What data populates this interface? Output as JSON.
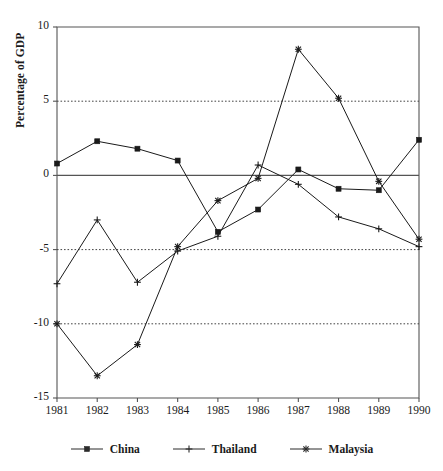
{
  "chart_data": {
    "type": "line",
    "title": "",
    "xlabel": "",
    "ylabel": "Percentage of GDP",
    "categories": [
      "1981",
      "1982",
      "1983",
      "1984",
      "1985",
      "1986",
      "1987",
      "1988",
      "1989",
      "1990"
    ],
    "x": [
      1981,
      1982,
      1983,
      1984,
      1985,
      1986,
      1987,
      1988,
      1989,
      1990
    ],
    "ylim": [
      -15,
      10
    ],
    "xlim": [
      1981,
      1990
    ],
    "yticks": [
      10,
      5,
      0,
      -5,
      -10,
      -15
    ],
    "ytick_labels": [
      "10",
      "5",
      "0",
      "-5",
      "-10",
      "-15"
    ],
    "gridlines_dotted_at": [
      5,
      -5,
      -10
    ],
    "zero_line": 0,
    "grid": "horizontal-dotted",
    "legend_position": "bottom",
    "series": [
      {
        "name": "China",
        "marker": "square",
        "color": "#1a1a1a",
        "values": [
          0.8,
          2.3,
          1.8,
          1.0,
          -3.8,
          -2.3,
          0.4,
          -0.9,
          -1.0,
          2.4
        ]
      },
      {
        "name": "Thailand",
        "marker": "plus",
        "color": "#1a1a1a",
        "values": [
          -7.3,
          -3.0,
          -7.2,
          -5.1,
          -4.1,
          0.7,
          -0.6,
          -2.8,
          -3.6,
          -4.8
        ]
      },
      {
        "name": "Malaysia",
        "marker": "asterisk",
        "color": "#1a1a1a",
        "values": [
          -10.0,
          -13.5,
          -11.4,
          -4.8,
          -1.7,
          -0.2,
          8.5,
          5.2,
          -0.4,
          -4.3
        ]
      }
    ]
  },
  "axis": {
    "y_label": "Percentage of GDP",
    "y_ticks": [
      "10",
      "5",
      "0",
      "-5",
      "-10",
      "-15"
    ],
    "x_ticks": [
      "1981",
      "1982",
      "1983",
      "1984",
      "1985",
      "1986",
      "1987",
      "1988",
      "1989",
      "1990"
    ]
  },
  "legend": {
    "items": [
      {
        "label": "China",
        "marker": "square-marker"
      },
      {
        "label": "Thailand",
        "marker": "plus-marker"
      },
      {
        "label": "Malaysia",
        "marker": "asterisk-marker"
      }
    ]
  },
  "colors": {
    "line": "#2b2b2b",
    "axis": "#555555",
    "grid": "#444444",
    "text": "#1a1a1a"
  }
}
